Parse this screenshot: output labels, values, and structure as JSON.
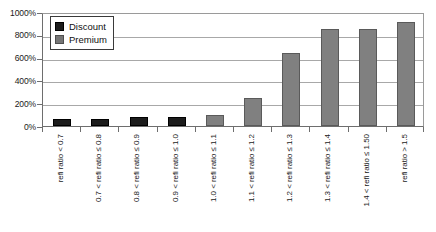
{
  "chart_data": {
    "type": "bar",
    "title": "",
    "subtitle": "",
    "xlabel": "",
    "ylabel": "",
    "ylim": [
      0,
      1000
    ],
    "ytick_labels": [
      "1000%",
      "800%",
      "600%",
      "400%",
      "200%",
      "0%"
    ],
    "ytick_values": [
      1000,
      800,
      600,
      400,
      200,
      0
    ],
    "grid": true,
    "legend_position": "top-left",
    "categories": [
      "refi ratio < 0.7",
      "0.7 < refi ratio ≤ 0.8",
      "0.8 < refi ratio ≤ 0.9",
      "0.9 < refi ratio ≤ 1.0",
      "1.0 < refi ratio ≤ 1.1",
      "1.1 < refi ratio ≤ 1.2",
      "1.2 < refi ratio ≤ 1.3",
      "1.3 < refi ratio ≤ 1.4",
      "1.4 < refi ratio ≤ 1.50",
      "refi ratio > 1.5"
    ],
    "series": [
      {
        "name": "Discount",
        "color": "#1c1c1c",
        "values": [
          60,
          60,
          75,
          80,
          null,
          null,
          null,
          null,
          null,
          null
        ]
      },
      {
        "name": "Premium",
        "color": "#808080",
        "values": [
          null,
          null,
          null,
          null,
          100,
          250,
          640,
          850,
          850,
          910
        ]
      }
    ],
    "bars": [
      {
        "category_index": 0,
        "series": "Discount",
        "value": 60
      },
      {
        "category_index": 1,
        "series": "Discount",
        "value": 60
      },
      {
        "category_index": 2,
        "series": "Discount",
        "value": 75
      },
      {
        "category_index": 3,
        "series": "Discount",
        "value": 80
      },
      {
        "category_index": 4,
        "series": "Premium",
        "value": 100
      },
      {
        "category_index": 5,
        "series": "Premium",
        "value": 250
      },
      {
        "category_index": 6,
        "series": "Premium",
        "value": 640
      },
      {
        "category_index": 7,
        "series": "Premium",
        "value": 850
      },
      {
        "category_index": 8,
        "series": "Premium",
        "value": 850
      },
      {
        "category_index": 9,
        "series": "Premium",
        "value": 910
      }
    ]
  },
  "legend": {
    "entries": [
      {
        "label": "Discount",
        "color": "#1c1c1c"
      },
      {
        "label": "Premium",
        "color": "#767676"
      }
    ]
  }
}
